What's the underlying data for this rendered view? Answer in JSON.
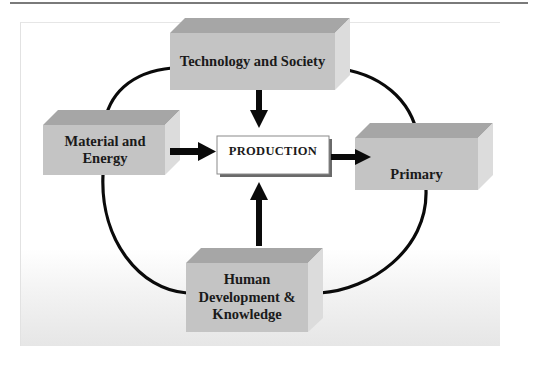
{
  "diagram": {
    "nodes": {
      "technology": {
        "label": "Technology and Society"
      },
      "material": {
        "label": "Material and Energy"
      },
      "production": {
        "label": "PRODUCTION"
      },
      "primary": {
        "label": "Primary"
      },
      "human": {
        "label": "Human Development & Knowledge"
      }
    },
    "edges": [
      {
        "from": "Technology and Society",
        "to": "PRODUCTION",
        "type": "arrow"
      },
      {
        "from": "Material and Energy",
        "to": "PRODUCTION",
        "type": "arrow"
      },
      {
        "from": "Human Development & Knowledge",
        "to": "PRODUCTION",
        "type": "arrow"
      },
      {
        "from": "PRODUCTION",
        "to": "Primary",
        "type": "arrow"
      },
      {
        "from": "Technology and Society",
        "to": "Material and Energy",
        "type": "curve"
      },
      {
        "from": "Technology and Society",
        "to": "Primary",
        "type": "curve"
      },
      {
        "from": "Material and Energy",
        "to": "Human Development & Knowledge",
        "type": "curve"
      },
      {
        "from": "Primary",
        "to": "Human Development & Knowledge",
        "type": "curve"
      }
    ],
    "colors": {
      "box_front": "#c4c4c4",
      "box_top": "#a6a6a6",
      "box_side": "#dcdcdc",
      "line": "#0a0a0a",
      "production_fill": "#ffffff"
    }
  }
}
